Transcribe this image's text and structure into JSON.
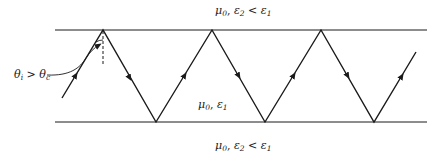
{
  "diagram": {
    "regions": {
      "top": {
        "mu": "μ",
        "mu_sub": "0",
        "sep": ", ",
        "eps": "ε",
        "eps_sub": "2",
        "rel": " < ",
        "eps2": "ε",
        "eps2_sub": "1"
      },
      "middle": {
        "mu": "μ",
        "mu_sub": "0",
        "sep": ", ",
        "eps": "ε",
        "eps_sub": "1"
      },
      "bottom": {
        "mu": "μ",
        "mu_sub": "0",
        "sep": ", ",
        "eps": "ε",
        "eps_sub": "2",
        "rel": " < ",
        "eps2": "ε",
        "eps2_sub": "1"
      }
    },
    "angle_label": {
      "theta": "θ",
      "i_sub": "i",
      "rel": " > ",
      "theta2": "θ",
      "c_sub": "c"
    },
    "colors": {
      "line": "#1a1a1a",
      "background": "#ffffff"
    }
  }
}
